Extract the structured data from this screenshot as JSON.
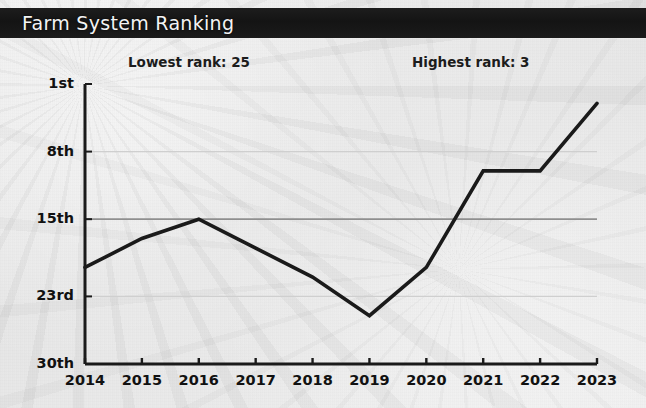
{
  "titlebar": {
    "title": "Farm System Ranking"
  },
  "annotations": {
    "lowest": "Lowest rank: 25",
    "highest": "Highest rank: 3"
  },
  "colors": {
    "title_bar": "#161616",
    "title_text": "#f3f3f3",
    "line": "#1a1a1a",
    "axis": "#1a1a1a",
    "gridline_major": "#8f8f8f",
    "gridline_minor": "#cfcfcf",
    "paper": "#eeeeee",
    "text": "#111111"
  },
  "chart_data": {
    "type": "line",
    "title": "Farm System Ranking",
    "xlabel": "",
    "ylabel": "",
    "x": [
      2014,
      2015,
      2016,
      2017,
      2018,
      2019,
      2020,
      2021,
      2022,
      2023
    ],
    "categories": [
      "2014",
      "2015",
      "2016",
      "2017",
      "2018",
      "2019",
      "2020",
      "2021",
      "2022",
      "2023"
    ],
    "series": [
      {
        "name": "Farm System Ranking",
        "values": [
          20,
          17,
          15,
          18,
          21,
          25,
          20,
          10,
          10,
          3
        ]
      }
    ],
    "values": [
      20,
      17,
      15,
      18,
      21,
      25,
      20,
      10,
      10,
      3
    ],
    "y_tick_labels": [
      "1st",
      "8th",
      "15th",
      "23rd",
      "30th"
    ],
    "y_tick_values": [
      1,
      8,
      15,
      23,
      30
    ],
    "x_tick_labels": [
      "2014",
      "2015",
      "2016",
      "2017",
      "2018",
      "2019",
      "2020",
      "2021",
      "2022",
      "2023"
    ],
    "ylim": [
      1,
      30
    ],
    "y_inverted": true,
    "xlim": [
      2014,
      2023
    ],
    "grid": true,
    "gridlines_y": [
      8,
      15,
      23
    ],
    "legend": "none",
    "annotations": [
      "Lowest rank: 25",
      "Highest rank: 3"
    ],
    "lowest_rank": 25,
    "highest_rank": 3
  }
}
